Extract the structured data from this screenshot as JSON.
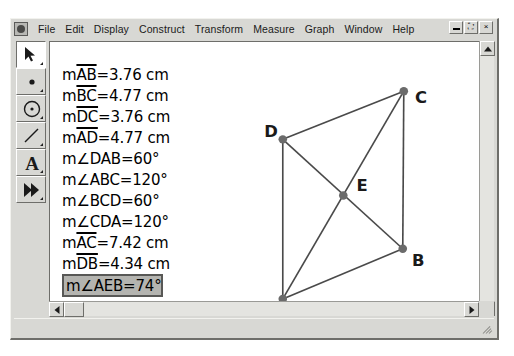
{
  "window": {
    "app_icon": "sketchpad-app-icon",
    "menus": [
      "File",
      "Edit",
      "Display",
      "Construct",
      "Transform",
      "Measure",
      "Graph",
      "Window",
      "Help"
    ],
    "controls": {
      "minimize": "minimize-icon",
      "restore": "restore-icon",
      "close": "close-icon",
      "close_label": "×",
      "restore_label": "⛶"
    }
  },
  "toolbox": {
    "tools": [
      {
        "name": "selection-arrow-tool",
        "label": "Selection Arrow Tool",
        "selected": true
      },
      {
        "name": "point-tool",
        "label": "Point Tool",
        "selected": false
      },
      {
        "name": "compass-tool",
        "label": "Compass Tool",
        "selected": false
      },
      {
        "name": "straightedge-tool",
        "label": "Straightedge Tool",
        "selected": false
      },
      {
        "name": "text-tool",
        "label": "Text Tool",
        "selected": false
      },
      {
        "name": "custom-tool",
        "label": "Custom Tool",
        "selected": false
      }
    ]
  },
  "measurements": [
    {
      "prefix": "m",
      "object": "AB",
      "overline": true,
      "angle": false,
      "value": "3.76 cm",
      "selected": false
    },
    {
      "prefix": "m",
      "object": "BC",
      "overline": true,
      "angle": false,
      "value": "4.77 cm",
      "selected": false
    },
    {
      "prefix": "m",
      "object": "DC",
      "overline": true,
      "angle": false,
      "value": "3.76 cm",
      "selected": false
    },
    {
      "prefix": "m",
      "object": "AD",
      "overline": true,
      "angle": false,
      "value": "4.77 cm",
      "selected": false
    },
    {
      "prefix": "m",
      "object": "DAB",
      "overline": false,
      "angle": true,
      "value": "60°",
      "selected": false
    },
    {
      "prefix": "m",
      "object": "ABC",
      "overline": false,
      "angle": true,
      "value": "120°",
      "selected": false
    },
    {
      "prefix": "m",
      "object": "BCD",
      "overline": false,
      "angle": true,
      "value": "60°",
      "selected": false
    },
    {
      "prefix": "m",
      "object": "CDA",
      "overline": false,
      "angle": true,
      "value": "120°",
      "selected": false
    },
    {
      "prefix": "m",
      "object": "AC",
      "overline": true,
      "angle": false,
      "value": "7.42 cm",
      "selected": false
    },
    {
      "prefix": "m",
      "object": "DB",
      "overline": true,
      "angle": false,
      "value": "4.34 cm",
      "selected": false
    },
    {
      "prefix": "m",
      "object": "AEB",
      "overline": false,
      "angle": true,
      "value": "74°",
      "selected": true
    }
  ],
  "figure": {
    "stroke_color": "#4a4a4a",
    "point_color": "#6b6b6b",
    "points": [
      {
        "label": "A",
        "x": 227,
        "y": 256,
        "label_dx": -12,
        "label_dy": 16
      },
      {
        "label": "B",
        "x": 344,
        "y": 206,
        "label_dx": 9,
        "label_dy": 17
      },
      {
        "label": "C",
        "x": 345,
        "y": 49,
        "label_dx": 11,
        "label_dy": 12
      },
      {
        "label": "D",
        "x": 227,
        "y": 97,
        "label_dx": -18,
        "label_dy": -2
      },
      {
        "label": "E",
        "x": 286,
        "y": 153,
        "label_dx": 13,
        "label_dy": -5
      }
    ],
    "segments": [
      {
        "from": "A",
        "to": "B",
        "name": "segment-ab"
      },
      {
        "from": "B",
        "to": "C",
        "name": "segment-bc"
      },
      {
        "from": "C",
        "to": "D",
        "name": "segment-cd"
      },
      {
        "from": "D",
        "to": "A",
        "name": "segment-da"
      },
      {
        "from": "A",
        "to": "C",
        "name": "diagonal-ac"
      },
      {
        "from": "D",
        "to": "B",
        "name": "diagonal-db"
      }
    ]
  },
  "scrollbars": {
    "vertical": {
      "up": "scroll-up-arrow",
      "down": "scroll-down-arrow"
    },
    "horizontal": {
      "left": "scroll-left-arrow",
      "right": "scroll-right-arrow"
    }
  },
  "status_bar": {
    "text": ""
  }
}
